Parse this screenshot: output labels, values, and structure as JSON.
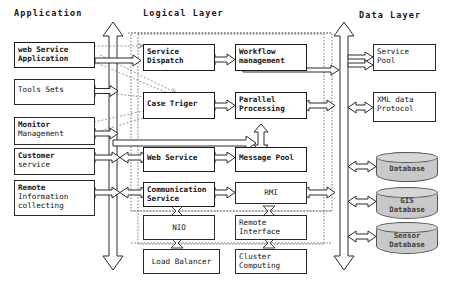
{
  "diagram": {
    "layers": [
      {
        "id": "application",
        "label": "Application"
      },
      {
        "id": "logical-layer",
        "label": "Logical Layer"
      },
      {
        "id": "data-layer",
        "label": "Data Layer"
      }
    ],
    "application_nodes": [
      {
        "id": "web-service-application",
        "lines": [
          "web Service",
          "Application"
        ]
      },
      {
        "id": "tools-sets",
        "lines": [
          "Tools Sets"
        ]
      },
      {
        "id": "monitor-management",
        "lines": [
          "Monitor",
          "Management"
        ]
      },
      {
        "id": "customer-service",
        "lines": [
          "Customer",
          "service"
        ]
      },
      {
        "id": "remote-information-collecting",
        "lines": [
          "Remote",
          "Information",
          "collecting"
        ]
      }
    ],
    "logical_nodes": [
      {
        "id": "service-dispatch",
        "lines": [
          "Service",
          "Dispatch"
        ]
      },
      {
        "id": "workflow-management",
        "lines": [
          "Workflow",
          "management"
        ]
      },
      {
        "id": "case-triger",
        "lines": [
          "Case Triger"
        ]
      },
      {
        "id": "parallel-processing",
        "lines": [
          "Parallel",
          "Processing"
        ]
      },
      {
        "id": "web-service",
        "lines": [
          "Web Service"
        ]
      },
      {
        "id": "message-pool",
        "lines": [
          "Message Pool"
        ]
      },
      {
        "id": "communication-service",
        "lines": [
          "Communication",
          "Service"
        ]
      },
      {
        "id": "rmi",
        "lines": [
          "RMI"
        ]
      },
      {
        "id": "nio",
        "lines": [
          "NIO"
        ]
      },
      {
        "id": "remote-interface",
        "lines": [
          "Remote",
          "Interface"
        ]
      },
      {
        "id": "load-balancer",
        "lines": [
          "Load Balancer"
        ]
      },
      {
        "id": "cluster-computing",
        "lines": [
          "Cluster",
          "Computing"
        ]
      }
    ],
    "data_nodes": [
      {
        "id": "service-pool",
        "lines": [
          "Service",
          "Pool"
        ]
      },
      {
        "id": "xml-data-protocol",
        "lines": [
          "XML data",
          "Protocol"
        ]
      }
    ],
    "data_stores": [
      {
        "id": "database",
        "lines": [
          "Database"
        ]
      },
      {
        "id": "gis-database",
        "lines": [
          "GIS",
          "Database"
        ]
      },
      {
        "id": "sensor-database",
        "lines": [
          "Sensor",
          "Database"
        ]
      }
    ],
    "colors": {
      "stroke": "#2a2a2a",
      "dashed": "#6a6a6a",
      "cylinder_fill": "#c8c8c8",
      "cylinder_top": "#d6d6d6",
      "background": "#ffffff"
    }
  }
}
